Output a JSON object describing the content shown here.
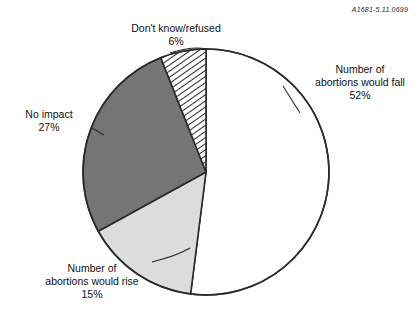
{
  "document": {
    "code": "A1681-5.11.0699"
  },
  "chart_data": {
    "type": "pie",
    "title": "",
    "subtitle": "",
    "xlabel": "",
    "ylabel": "",
    "legend_position": "none",
    "grid": false,
    "units": "percent",
    "start_angle_deg": 0,
    "direction": "clockwise",
    "center": {
      "x": 206,
      "y": 172
    },
    "radius": 123,
    "categories": [
      "Number of abortions would fall",
      "Number of abortions would rise",
      "No impact",
      "Don't know/refused"
    ],
    "values": [
      52,
      15,
      27,
      6
    ],
    "slices": [
      {
        "label_line1": "Number of",
        "label_line2": "abortions would fall",
        "percent_text": "52%",
        "value": 52,
        "fill": "#ffffff",
        "pattern": "solid",
        "stroke": "#2b2b2b"
      },
      {
        "label_line1": "Number of",
        "label_line2": "abortions would rise",
        "percent_text": "15%",
        "value": 15,
        "fill": "#dcdcdc",
        "pattern": "solid",
        "stroke": "#2b2b2b"
      },
      {
        "label_line1": "No impact",
        "label_line2": "",
        "percent_text": "27%",
        "value": 27,
        "fill": "#757575",
        "pattern": "solid",
        "stroke": "#2b2b2b"
      },
      {
        "label_line1": "Don't know/refused",
        "label_line2": "",
        "percent_text": "6%",
        "value": 6,
        "fill": "#ffffff",
        "pattern": "diagonal-hatch",
        "stroke": "#2b2b2b"
      }
    ]
  },
  "labels": {
    "dontknow": {
      "line1": "Don't know/refused",
      "pct": "6%"
    },
    "fall": {
      "line1": "Number of",
      "line2": "abortions would fall",
      "pct": "52%"
    },
    "noimpact": {
      "line1": "No impact",
      "pct": "27%"
    },
    "rise": {
      "line1": "Number of",
      "line2": "abortions would rise",
      "pct": "15%"
    }
  },
  "colors": {
    "slice_fall": "#ffffff",
    "slice_rise": "#dcdcdc",
    "slice_noimpact": "#757575",
    "slice_dontknow_hatch": "#2b2b2b",
    "outline": "#2b2b2b",
    "text": "#111111"
  }
}
